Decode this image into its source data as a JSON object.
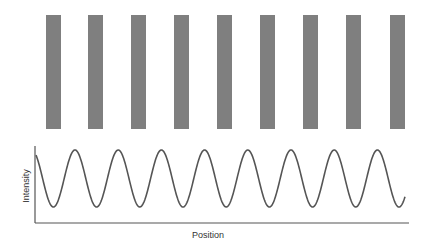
{
  "figure": {
    "bars": {
      "count": 9,
      "x": [
        46,
        88,
        131,
        174,
        217,
        260,
        303,
        346,
        390
      ],
      "width": 15,
      "top": 15,
      "bottom": 129,
      "color": "#7f7f7f"
    },
    "plot": {
      "axis_origin": [
        35,
        223
      ],
      "axis_x_end": 409,
      "axis_y_top": 146,
      "curve_color": "#555555",
      "curve": {
        "start_x": 36,
        "end_x": 405,
        "period": 43.2,
        "peak_x_first": 75,
        "y_max": 150,
        "y_min": 207
      },
      "xlabel": "Position",
      "ylabel": "Intensity"
    }
  },
  "chart_data": {
    "type": "line",
    "title": "",
    "xlabel": "Position",
    "ylabel": "Intensity",
    "series": [
      {
        "name": "Intensity profile",
        "shape": "sinusoid",
        "peaks_at_position_px": [
          75,
          118,
          161,
          204,
          246,
          290,
          333,
          376
        ],
        "cycles": 8.5
      }
    ],
    "grid": false,
    "legend": null
  }
}
